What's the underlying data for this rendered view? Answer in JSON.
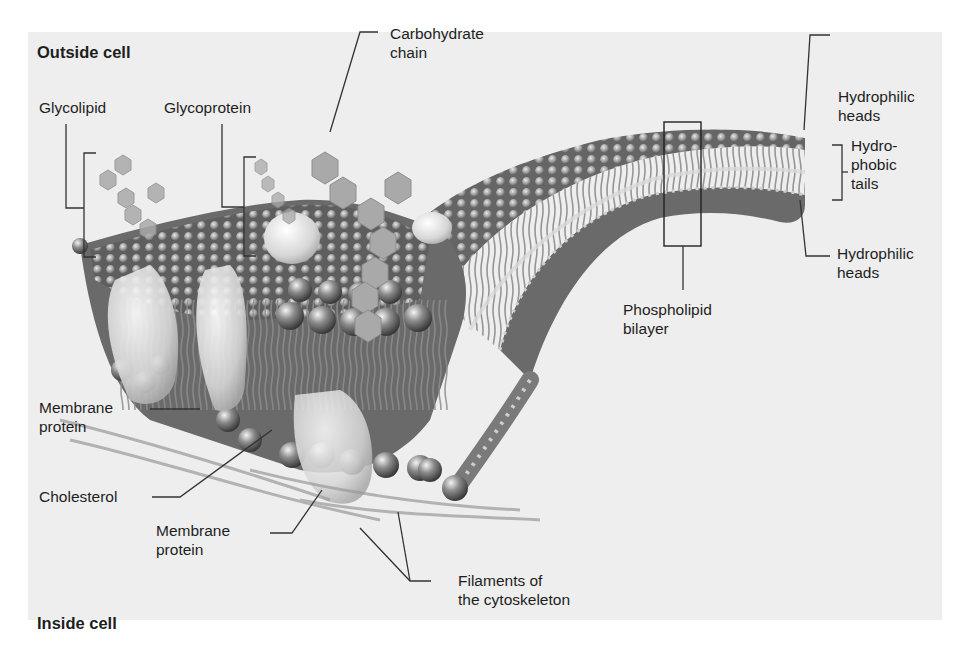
{
  "figure": {
    "outside_label": "Outside cell",
    "inside_label": "Inside cell"
  },
  "labels": {
    "glycolipid": "Glycolipid",
    "glycoprotein": "Glycoprotein",
    "carbohydrate_chain": [
      "Carbohydrate",
      "chain"
    ],
    "hydrophilic_heads_top": [
      "Hydrophilic",
      "heads"
    ],
    "hydrophobic_tails": [
      "Hydro-",
      "phobic",
      "tails"
    ],
    "hydrophilic_heads_bottom": [
      "Hydrophilic",
      "heads"
    ],
    "phospholipid_bilayer": [
      "Phospholipid",
      "bilayer"
    ],
    "membrane_protein_left": [
      "Membrane",
      "protein"
    ],
    "cholesterol": "Cholesterol",
    "membrane_protein_bottom": [
      "Membrane",
      "protein"
    ],
    "filaments": [
      "Filaments of",
      "the cytoskeleton"
    ]
  },
  "colors": {
    "panel_bg": "#eeeeee",
    "membrane_dark": "#5a5a5a",
    "head_light": "#bdbdbd",
    "tail": "#8a8a8a",
    "carbohydrate": "#a9a9a9",
    "leader_line": "#333333"
  }
}
